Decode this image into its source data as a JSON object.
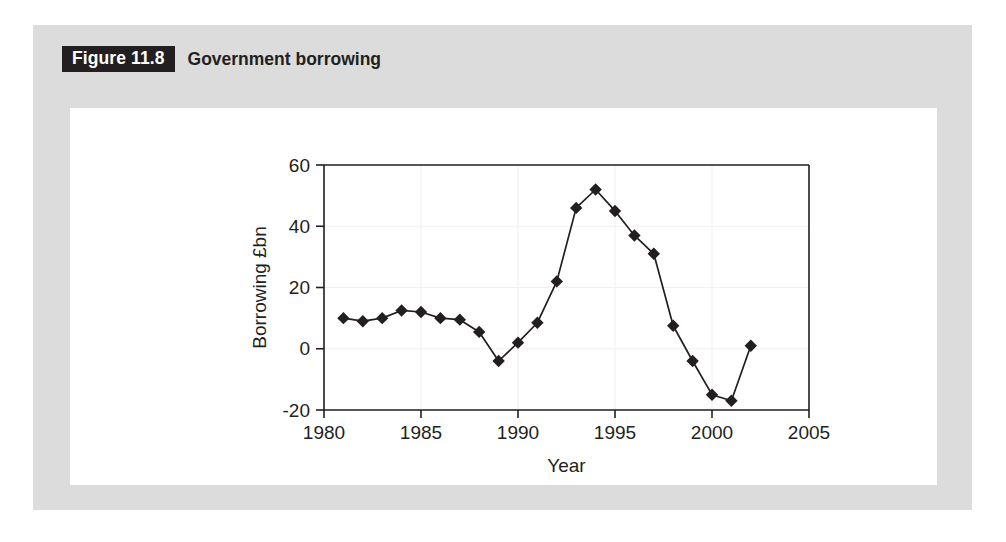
{
  "figure": {
    "tag": "Figure 11.8",
    "title": "Government borrowing"
  },
  "colors": {
    "panel_bg": "#dcdcdc",
    "card_bg": "#ffffff",
    "ink": "#231f20",
    "tag_bg": "#231f20",
    "tag_text": "#ffffff",
    "grid": "#f0f0f0"
  },
  "chart_data": {
    "type": "line",
    "title": "Government borrowing",
    "xlabel": "Year",
    "ylabel": "Borrowing £bn",
    "xlim": [
      1980,
      2005
    ],
    "ylim": [
      -20,
      60
    ],
    "xticks": [
      1980,
      1985,
      1990,
      1995,
      2000,
      2005
    ],
    "xtick_labels": [
      "1980",
      "1985",
      "1990",
      "1995",
      "2000",
      "2005"
    ],
    "yticks": [
      -20,
      0,
      20,
      40,
      60
    ],
    "ytick_labels": [
      "-20",
      "0",
      "20",
      "40",
      "60"
    ],
    "grid": true,
    "legend": false,
    "marker": "diamond",
    "x": [
      1981,
      1982,
      1983,
      1984,
      1985,
      1986,
      1987,
      1988,
      1989,
      1990,
      1991,
      1992,
      1993,
      1994,
      1995,
      1996,
      1997,
      1998,
      1999,
      2000,
      2001,
      2002
    ],
    "values": [
      10,
      9,
      10,
      12.5,
      12,
      10,
      9.5,
      5.5,
      -4,
      2,
      8.5,
      22,
      46,
      52,
      45,
      37,
      31,
      7.5,
      -4,
      -15,
      -17,
      1
    ],
    "series": [
      {
        "name": "Borrowing £bn",
        "values": [
          10,
          9,
          10,
          12.5,
          12,
          10,
          9.5,
          5.5,
          -4,
          2,
          8.5,
          22,
          46,
          52,
          45,
          37,
          31,
          7.5,
          -4,
          -15,
          -17,
          1
        ]
      }
    ]
  }
}
